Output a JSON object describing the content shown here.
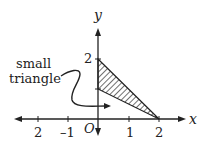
{
  "diagram": {
    "axes": {
      "x_label": "x",
      "y_label": "y",
      "origin_label": "O",
      "x_ticks": [
        {
          "value": -2,
          "label": "2"
        },
        {
          "value": -1,
          "label": "–1"
        },
        {
          "value": 1,
          "label": "1"
        },
        {
          "value": 2,
          "label": "2"
        }
      ],
      "y_ticks": [
        {
          "value": 1,
          "label": ""
        },
        {
          "value": 2,
          "label": "2"
        }
      ]
    },
    "shaded_region": {
      "name": "small triangle",
      "vertices": [
        [
          0,
          2
        ],
        [
          0,
          1
        ],
        [
          2,
          0
        ]
      ],
      "fill": "diagonal hatch"
    },
    "annotation": {
      "line1": "small",
      "line2": "triangle"
    },
    "colors": {
      "ink": "#222222",
      "background": "#ffffff"
    }
  }
}
